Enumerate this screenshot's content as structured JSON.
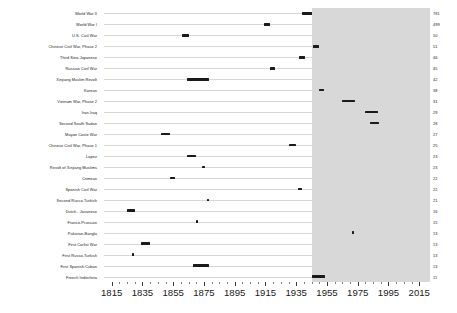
{
  "chart_data": {
    "type": "bar",
    "orientation": "horizontal",
    "title": "",
    "subtitle": "",
    "xlabel": "",
    "ylabel": "",
    "xlim": [
      1810,
      2022
    ],
    "grid": true,
    "legend": null,
    "annotations": [
      {
        "name": "shaded-band",
        "label": "",
        "x_start": 1945,
        "x_end": 2022,
        "color": "#c9c9c9"
      }
    ],
    "xticks": [
      {
        "value": 1815,
        "label": "1815"
      },
      {
        "value": 1835,
        "label": "1835"
      },
      {
        "value": 1855,
        "label": "1855"
      },
      {
        "value": 1875,
        "label": "1875"
      },
      {
        "value": 1895,
        "label": "1895"
      },
      {
        "value": 1915,
        "label": "1915"
      },
      {
        "value": 1935,
        "label": "1935"
      },
      {
        "value": 1955,
        "label": "1955"
      },
      {
        "value": 1975,
        "label": "1975"
      },
      {
        "value": 1995,
        "label": "1995"
      },
      {
        "value": 2015,
        "label": "2015"
      }
    ],
    "minor_xticks": [
      1820,
      1825,
      1830,
      1840,
      1845,
      1850,
      1860,
      1865,
      1870,
      1880,
      1885,
      1890,
      1900,
      1905,
      1910,
      1920,
      1925,
      1930,
      1940,
      1945,
      1950,
      1960,
      1965,
      1970,
      1980,
      1985,
      1990,
      2000,
      2005,
      2010
    ],
    "categories": [
      "World War II",
      "World War I",
      "U.S. Civil War",
      "Chinese Civil War, Phase 2",
      "Third Sino-Japanese",
      "Russian Civil War",
      "Xinjiang Muslim Revolt",
      "Korean",
      "Vietnam War, Phase 2",
      "Iran-Iraq",
      "Second South Sudan",
      "Mayan Caste War",
      "Chinese Civil War, Phase 1",
      "Lopez",
      "Revolt of Xinjiang Muslims",
      "Crimean",
      "Spanish Civil War",
      "Second Russo-Turkish",
      "Dutch - Javanese",
      "Franco-Prussian",
      "Pakistan-Bangla",
      "First Carlist War",
      "First Russo-Turkish",
      "First Spanish-Cuban",
      "French Indochina"
    ],
    "values": [
      781,
      499,
      50,
      51,
      46,
      45,
      42,
      38,
      31,
      29,
      28,
      27,
      25,
      23,
      23,
      22,
      22,
      21,
      16,
      15,
      13,
      13,
      13,
      13,
      11
    ],
    "bars": [
      {
        "label": "World War II",
        "value": 781,
        "start": 1939,
        "end": 1945
      },
      {
        "label": "World War I",
        "value": 499,
        "start": 1914,
        "end": 1918
      },
      {
        "label": "U.S. Civil War",
        "value": 50,
        "start": 1861,
        "end": 1865
      },
      {
        "label": "Chinese Civil War, Phase 2",
        "value": 51,
        "start": 1946,
        "end": 1950
      },
      {
        "label": "Third Sino-Japanese",
        "value": 46,
        "start": 1937,
        "end": 1941
      },
      {
        "label": "Russian Civil War",
        "value": 45,
        "start": 1918,
        "end": 1921
      },
      {
        "label": "Xinjiang Muslim Revolt",
        "value": 42,
        "start": 1864,
        "end": 1878
      },
      {
        "label": "Korean",
        "value": 38,
        "start": 1950,
        "end": 1953
      },
      {
        "label": "Vietnam War, Phase 2",
        "value": 31,
        "start": 1965,
        "end": 1973
      },
      {
        "label": "Iran-Iraq",
        "value": 29,
        "start": 1980,
        "end": 1988
      },
      {
        "label": "Second South Sudan",
        "value": 28,
        "start": 1983,
        "end": 1989
      },
      {
        "label": "Mayan Caste War",
        "value": 27,
        "start": 1847,
        "end": 1853
      },
      {
        "label": "Chinese Civil War, Phase 1",
        "value": 25,
        "start": 1930,
        "end": 1935
      },
      {
        "label": "Lopez",
        "value": 23,
        "start": 1864,
        "end": 1870
      },
      {
        "label": "Revolt of Xinjiang Muslims",
        "value": 23,
        "start": 1874,
        "end": 1876
      },
      {
        "label": "Crimean",
        "value": 22,
        "start": 1853,
        "end": 1856
      },
      {
        "label": "Spanish Civil War",
        "value": 22,
        "start": 1936,
        "end": 1939
      },
      {
        "label": "Second Russo-Turkish",
        "value": 21,
        "start": 1877,
        "end": 1878
      },
      {
        "label": "Dutch - Javanese",
        "value": 16,
        "start": 1825,
        "end": 1830
      },
      {
        "label": "Franco-Prussian",
        "value": 15,
        "start": 1870,
        "end": 1871
      },
      {
        "label": "Pakistan-Bangla",
        "value": 13,
        "start": 1971,
        "end": 1972
      },
      {
        "label": "First Carlist War",
        "value": 13,
        "start": 1834,
        "end": 1840
      },
      {
        "label": "First Russo-Turkish",
        "value": 13,
        "start": 1828,
        "end": 1829
      },
      {
        "label": "First Spanish-Cuban",
        "value": 13,
        "start": 1868,
        "end": 1878
      },
      {
        "label": "French Indochina",
        "value": 11,
        "start": 1945,
        "end": 1954
      }
    ],
    "value_labels": [
      "781",
      "499",
      "50",
      "51",
      "46",
      "45",
      "42",
      "38",
      "31",
      "29",
      "28",
      "27",
      "25",
      "23",
      "23",
      "22",
      "22",
      "21",
      "16",
      "15",
      "13",
      "13",
      "13",
      "13",
      "11"
    ]
  }
}
